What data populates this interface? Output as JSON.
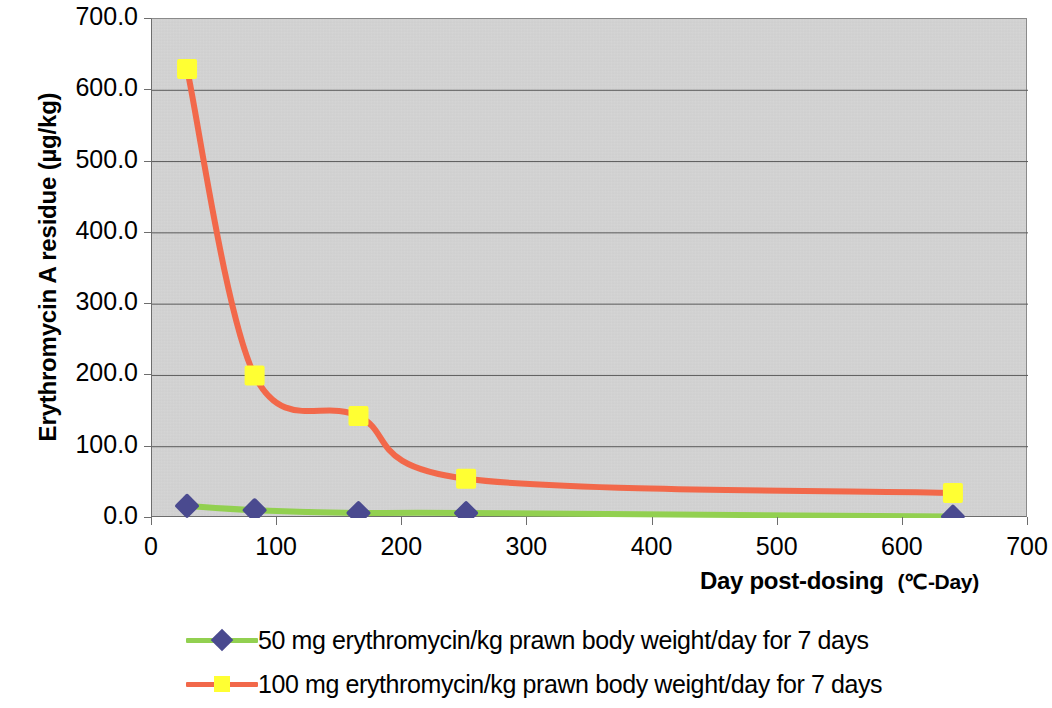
{
  "chart_data": {
    "type": "line",
    "title": "",
    "xlabel": "Day post-dosing",
    "xlabel_unit": "(℃-Day)",
    "ylabel": "Erythromycin A residue (µg/kg)",
    "xlim": [
      0,
      700
    ],
    "ylim": [
      0,
      700
    ],
    "xticks": [
      0,
      100,
      200,
      300,
      400,
      500,
      600,
      700
    ],
    "xticklabels": [
      "0",
      "100",
      "200",
      "300",
      "400",
      "500",
      "600",
      "700"
    ],
    "yticks": [
      0,
      100,
      200,
      300,
      400,
      500,
      600,
      700
    ],
    "yticklabels": [
      "0.0",
      "100.0",
      "200.0",
      "300.0",
      "400.0",
      "500.0",
      "600.0",
      "700.0"
    ],
    "grid": "horizontal",
    "smoothing": "spline",
    "plot_background": "#c9c9c9",
    "legend_position": "bottom",
    "x": [
      28,
      82,
      165,
      251,
      640
    ],
    "series": [
      {
        "name": "50 mg erythromycin/kg prawn body weight/day for 7 days",
        "values": [
          17,
          11,
          7,
          7,
          2
        ],
        "line_color": "#92d050",
        "marker_color": "#4a4a8f",
        "marker": "diamond"
      },
      {
        "name": "100 mg erythromycin/kg prawn body weight/day for 7 days",
        "values": [
          630,
          200,
          143,
          55,
          35
        ],
        "line_color": "#f2684a",
        "marker_color": "#ffff33",
        "marker": "square"
      }
    ]
  },
  "legend": {
    "items": [
      {
        "label": "50 mg erythromycin/kg prawn body weight/day for 7 days"
      },
      {
        "label": "100 mg erythromycin/kg prawn body weight/day for 7 days"
      }
    ]
  }
}
